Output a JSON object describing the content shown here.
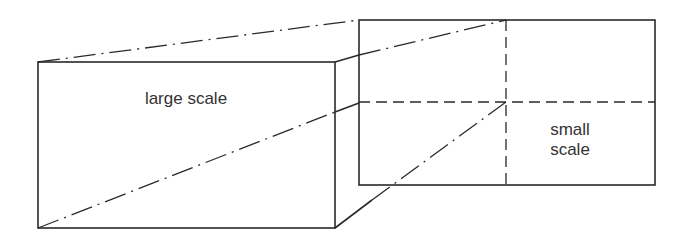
{
  "diagram": {
    "type": "scale-projection",
    "labels": {
      "large": "large scale",
      "small_line1": "small",
      "small_line2": "scale"
    },
    "line_color": "#2a2a2a",
    "text_color": "#333333"
  }
}
